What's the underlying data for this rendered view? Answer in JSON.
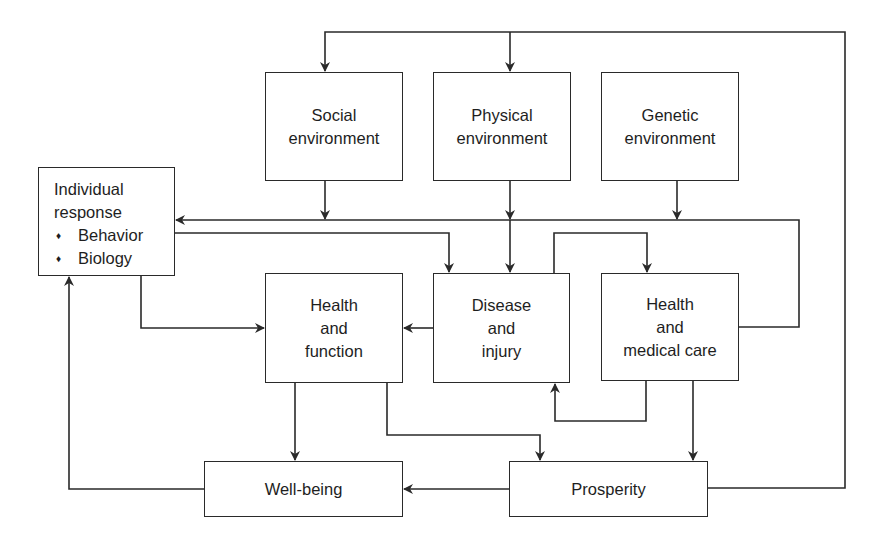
{
  "diagram": {
    "type": "flowchart",
    "nodes": {
      "social_environment": {
        "line1": "Social",
        "line2": "environment"
      },
      "physical_environment": {
        "line1": "Physical",
        "line2": "environment"
      },
      "genetic_environment": {
        "line1": "Genetic",
        "line2": "environment"
      },
      "individual_response": {
        "line1": "Individual",
        "line2": "response",
        "bullets": [
          "Behavior",
          "Biology"
        ],
        "bullet_glyph": "♦"
      },
      "health_and_function": {
        "line1": "Health",
        "line2": "and",
        "line3": "function"
      },
      "disease_and_injury": {
        "line1": "Disease",
        "line2": "and",
        "line3": "injury"
      },
      "health_and_medical_care": {
        "line1": "Health",
        "line2": "and",
        "line3": "medical care"
      },
      "well_being": {
        "label": "Well-being"
      },
      "prosperity": {
        "label": "Prosperity"
      }
    },
    "edges": [
      {
        "from": "Prosperity",
        "to": "Social environment"
      },
      {
        "from": "Prosperity",
        "to": "Physical environment"
      },
      {
        "from": "Social environment",
        "to": "Individual response"
      },
      {
        "from": "Physical environment",
        "to": "Disease and injury"
      },
      {
        "from": "Genetic environment",
        "to": "Individual response"
      },
      {
        "from": "Health and medical care",
        "to": "Individual response"
      },
      {
        "from": "Individual response",
        "to": "Disease and injury"
      },
      {
        "from": "Individual response",
        "to": "Health and function"
      },
      {
        "from": "Disease and injury",
        "to": "Health and function"
      },
      {
        "from": "Disease and injury",
        "to": "Health and medical care"
      },
      {
        "from": "Health and medical care",
        "to": "Disease and injury"
      },
      {
        "from": "Health and function",
        "to": "Well-being"
      },
      {
        "from": "Health and function",
        "to": "Prosperity"
      },
      {
        "from": "Health and medical care",
        "to": "Prosperity"
      },
      {
        "from": "Prosperity",
        "to": "Well-being"
      },
      {
        "from": "Well-being",
        "to": "Individual response"
      }
    ],
    "colors": {
      "line": "#2a2a2a",
      "background": "#ffffff",
      "text": "#1e1e1e"
    }
  }
}
